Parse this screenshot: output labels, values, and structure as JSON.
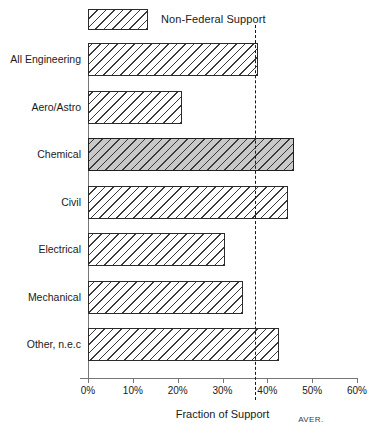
{
  "legend": {
    "swatch_name": "hatched-swatch",
    "label": "Non-Federal Support"
  },
  "axis": {
    "x_title": "Fraction of Support",
    "average_marker_label": "AVER."
  },
  "chart_data": {
    "type": "bar",
    "orientation": "horizontal",
    "title": "",
    "xlabel": "Fraction of Support",
    "ylabel": "",
    "xlim": [
      0,
      60
    ],
    "xticks": [
      0,
      10,
      20,
      30,
      40,
      50,
      60
    ],
    "xtick_labels": [
      "0%",
      "10%",
      "20%",
      "30%",
      "40%",
      "50%",
      "60%"
    ],
    "grid": false,
    "legend_position": "top-left",
    "series": [
      {
        "name": "Non-Federal Support",
        "values": [
          38.0,
          21.0,
          46.0,
          44.5,
          30.5,
          34.5,
          42.5
        ]
      }
    ],
    "categories": [
      "All Engineering",
      "Aero/Astro",
      "Chemical",
      "Civil",
      "Electrical",
      "Mechanical",
      "Other, n.e.c"
    ],
    "value_labels": [
      "38%",
      "21%",
      "46%",
      "44.5%",
      "30.5%",
      "34.5%",
      "42.5%"
    ],
    "highlighted_category": "Chemical",
    "annotations": [
      {
        "type": "vertical-dashed-line",
        "value": 37.3,
        "label": "AVER."
      }
    ]
  }
}
